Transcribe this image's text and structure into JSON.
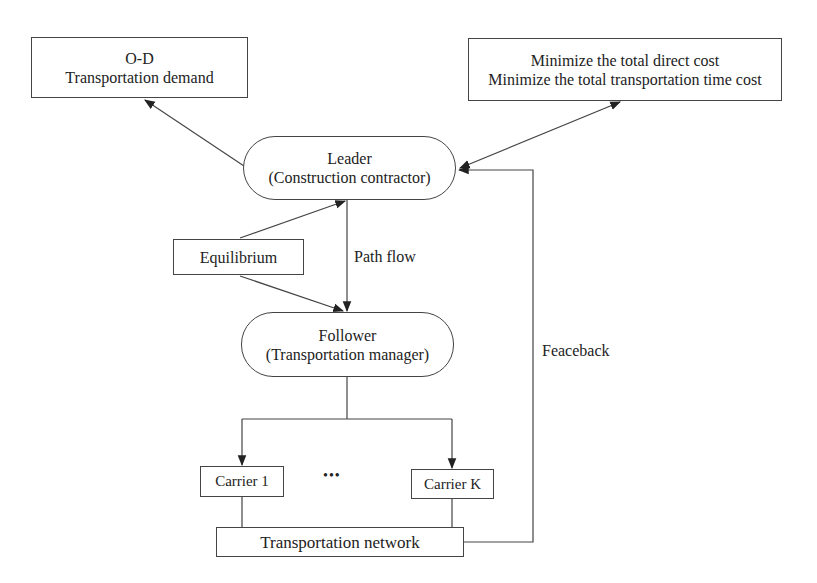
{
  "diagram": {
    "nodes": {
      "od": {
        "line1": "O-D",
        "line2": "Transportation demand"
      },
      "objectives": {
        "line1": "Minimize the total direct cost",
        "line2": "Minimize the total transportation time cost"
      },
      "leader": {
        "line1": "Leader",
        "line2": "(Construction contractor)"
      },
      "equilibrium": {
        "label": "Equilibrium"
      },
      "follower": {
        "line1": "Follower",
        "line2": "(Transportation manager)"
      },
      "carrier_1": {
        "label": "Carrier 1"
      },
      "carrier_k": {
        "label": "Carrier K"
      },
      "network": {
        "label": "Transportation network"
      }
    },
    "edge_labels": {
      "path_flow": "Path flow",
      "feedback": "Feaceback"
    },
    "ellipsis": "•••"
  }
}
